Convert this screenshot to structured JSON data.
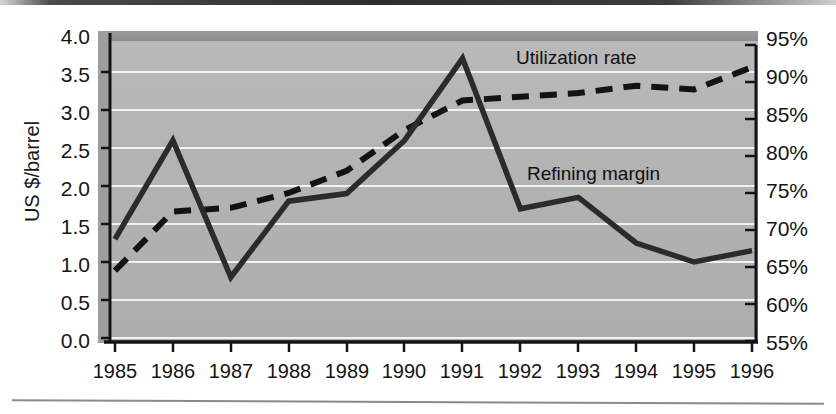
{
  "chart_data": {
    "type": "line",
    "title": "",
    "xlabel": "",
    "ylabel": "US $/barrel",
    "y2label": "",
    "x": [
      1985,
      1986,
      1987,
      1988,
      1989,
      1990,
      1991,
      1992,
      1993,
      1994,
      1995,
      1996
    ],
    "categories": [
      "1985",
      "1986",
      "1987",
      "1988",
      "1989",
      "1990",
      "1991",
      "1992",
      "1993",
      "1994",
      "1995",
      "1996"
    ],
    "ylim": [
      0.0,
      4.0
    ],
    "y2lim": [
      55,
      95
    ],
    "yticks": [
      "0.0",
      "0.5",
      "1.0",
      "1.5",
      "2.0",
      "2.5",
      "3.0",
      "3.5",
      "4.0"
    ],
    "ytick_values": [
      0.0,
      0.5,
      1.0,
      1.5,
      2.0,
      2.5,
      3.0,
      3.5,
      4.0
    ],
    "y2ticks": [
      "55%",
      "60%",
      "65%",
      "70%",
      "75%",
      "80%",
      "85%",
      "90%",
      "95%"
    ],
    "y2tick_values": [
      55,
      60,
      65,
      70,
      75,
      80,
      85,
      90,
      95
    ],
    "grid": true,
    "legend_position": "inline-annotation",
    "series": [
      {
        "name": "Refining margin",
        "axis": "left",
        "style": "solid",
        "color": "#2b2b2b",
        "values": [
          1.3,
          2.6,
          0.8,
          1.8,
          1.9,
          2.6,
          3.68,
          1.7,
          1.85,
          1.25,
          1.0,
          1.15
        ],
        "units": "US $/barrel"
      },
      {
        "name": "Utilization rate",
        "axis": "right",
        "style": "dashed",
        "color": "#131313",
        "values": [
          64.5,
          72.5,
          73.0,
          75.0,
          78.0,
          83.5,
          87.5,
          88.0,
          88.5,
          89.5,
          89.0,
          92.0
        ],
        "units": "%"
      }
    ],
    "annotations": [
      {
        "text": "Utilization rate",
        "x": 1991.0,
        "y2": 93.5
      },
      {
        "text": "Refining margin",
        "x": 1991.3,
        "y": 2.15
      }
    ]
  },
  "axes": {
    "y_axis_title": "US $/barrel"
  }
}
